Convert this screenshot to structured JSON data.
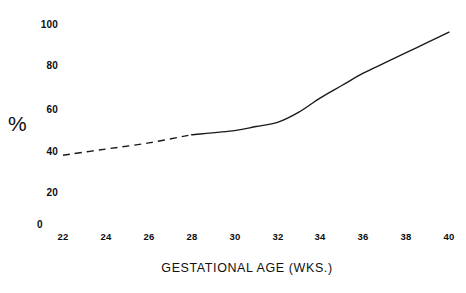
{
  "chart_data": {
    "type": "line",
    "title": "",
    "xlabel": "GESTATIONAL AGE  (WKS.)",
    "ylabel": "%",
    "xlim": [
      22,
      40
    ],
    "ylim": [
      0,
      100
    ],
    "grid": false,
    "legend": "none",
    "x_ticks": [
      "22",
      "24",
      "26",
      "28",
      "30",
      "32",
      "34",
      "36",
      "38",
      "40"
    ],
    "y_ticks": [
      "0",
      "20",
      "40",
      "60",
      "80",
      "100"
    ],
    "origin_label": "0",
    "x": [
      22,
      24,
      26,
      28,
      30,
      31,
      32,
      33,
      34,
      35,
      36,
      37,
      38,
      39,
      40
    ],
    "series": [
      {
        "name": "survival",
        "style_note": "dashed from 22 to 28 weeks, solid from 28 to 40 weeks",
        "dash_break_x": 28,
        "values": [
          36,
          39,
          42,
          46,
          48,
          50,
          52,
          57,
          64,
          70,
          76,
          81,
          86,
          91,
          96
        ]
      }
    ],
    "colors": {
      "line": "#1a1a1a",
      "text": "#0d0d0d",
      "background": "#ffffff"
    }
  },
  "axis": {
    "y_label_text": "%",
    "x_title_text": "GESTATIONAL AGE  (WKS.)"
  }
}
